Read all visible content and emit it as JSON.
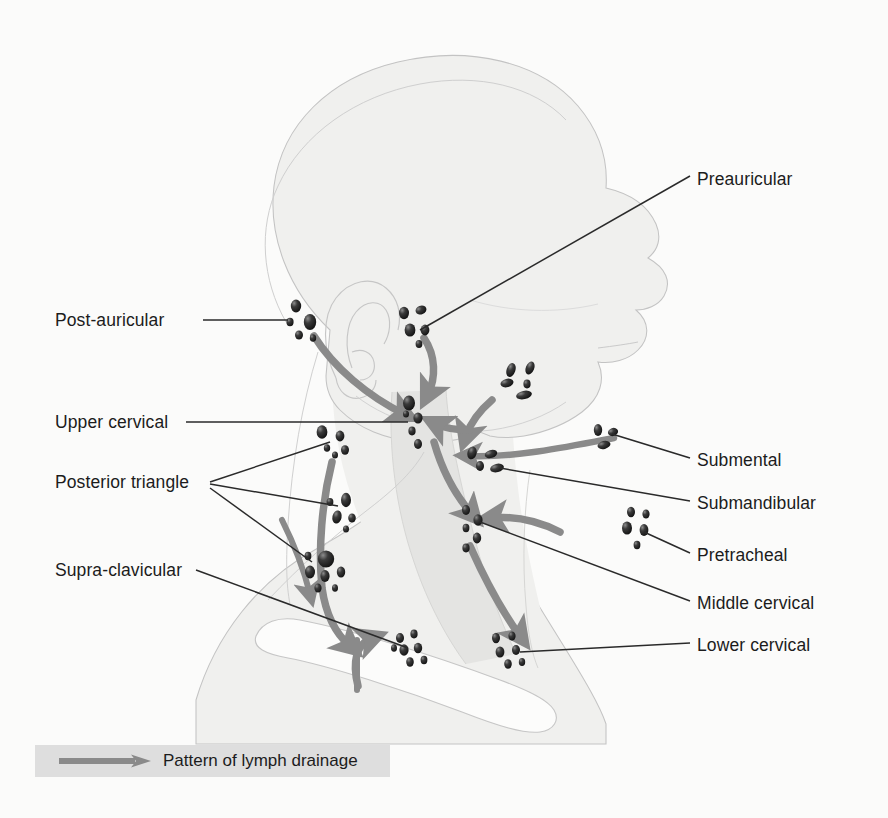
{
  "figure": {
    "background_color": "#fbfbfa",
    "arrow_color": "#8a8a8a",
    "node_color": "#1a1a1a",
    "outline_color": "#b9b9b9",
    "skin_fill": "#f0f0ee",
    "muscle_fill": "#e4e4e2",
    "bone_fill": "#fcfcfb",
    "leader_color": "#2a2a2a"
  },
  "legend": {
    "label": "Pattern of lymph drainage",
    "icon": "arrow-right-icon",
    "band_color": "#dedede",
    "arrow_color": "#8a8a8a"
  },
  "labels_left": [
    {
      "id": "post-auricular",
      "text": "Post-auricular",
      "x": 55,
      "y": 312
    },
    {
      "id": "upper-cervical",
      "text": "Upper cervical",
      "x": 55,
      "y": 414
    },
    {
      "id": "posterior-triangle",
      "text": "Posterior triangle",
      "x": 55,
      "y": 474
    },
    {
      "id": "supra-clavicular",
      "text": "Supra-clavicular",
      "x": 55,
      "y": 562
    }
  ],
  "labels_right": [
    {
      "id": "preauricular",
      "text": "Preauricular",
      "x": 697,
      "y": 171
    },
    {
      "id": "submental",
      "text": "Submental",
      "x": 697,
      "y": 452
    },
    {
      "id": "submandibular",
      "text": "Submandibular",
      "x": 697,
      "y": 495
    },
    {
      "id": "pretracheal",
      "text": "Pretracheal",
      "x": 697,
      "y": 547
    },
    {
      "id": "middle-cervical",
      "text": "Middle cervical",
      "x": 697,
      "y": 595
    },
    {
      "id": "lower-cervical",
      "text": "Lower cervical",
      "x": 697,
      "y": 637
    }
  ],
  "node_groups": [
    {
      "id": "post-auricular",
      "label": "Post-auricular",
      "count": 5
    },
    {
      "id": "preauricular",
      "label": "Preauricular",
      "count": 5
    },
    {
      "id": "parotid-facial",
      "label": "Facial",
      "count": 5
    },
    {
      "id": "upper-cervical",
      "label": "Upper cervical",
      "count": 5
    },
    {
      "id": "posterior-upper",
      "label": "Posterior triangle upper",
      "count": 5
    },
    {
      "id": "posterior-middle",
      "label": "Posterior triangle middle",
      "count": 5
    },
    {
      "id": "supra-clavicular",
      "label": "Supra-clavicular",
      "count": 7
    },
    {
      "id": "submental",
      "label": "Submental",
      "count": 3
    },
    {
      "id": "submandibular",
      "label": "Submandibular",
      "count": 4
    },
    {
      "id": "middle-cervical",
      "label": "Middle cervical",
      "count": 5
    },
    {
      "id": "pretracheal",
      "label": "Pretracheal",
      "count": 5
    },
    {
      "id": "lower-cervical-med",
      "label": "Lower cervical medial",
      "count": 7
    },
    {
      "id": "lower-cervical-lat",
      "label": "Lower cervical lateral",
      "count": 6
    }
  ],
  "drainage_arrows": [
    {
      "id": "postauricular-to-upper",
      "from": "post-auricular",
      "to": "upper-cervical"
    },
    {
      "id": "preauricular-to-upper",
      "from": "preauricular",
      "to": "upper-cervical"
    },
    {
      "id": "facial-to-upper",
      "from": "parotid-facial",
      "to": "upper-cervical"
    },
    {
      "id": "submandibular-to-upper",
      "from": "submandibular",
      "to": "upper-cervical"
    },
    {
      "id": "submental-to-submandibular",
      "from": "submental",
      "to": "submandibular"
    },
    {
      "id": "upper-to-middle",
      "from": "upper-cervical",
      "to": "middle-cervical"
    },
    {
      "id": "pretracheal-to-middle",
      "from": "pretracheal",
      "to": "middle-cervical"
    },
    {
      "id": "middle-to-lower",
      "from": "middle-cervical",
      "to": "lower-cervical-lat"
    },
    {
      "id": "posterior-to-supraclav",
      "from": "posterior-triangle",
      "to": "supra-clavicular"
    },
    {
      "id": "supraclav-ascending",
      "from": "thoracic-duct",
      "to": "supra-clavicular"
    }
  ]
}
